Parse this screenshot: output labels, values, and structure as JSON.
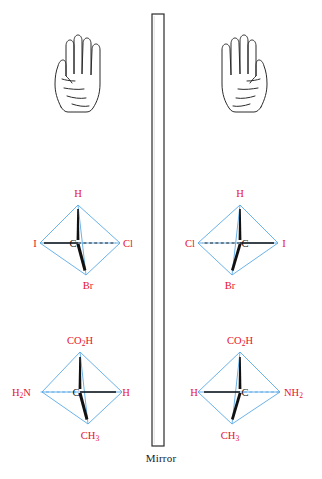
{
  "figure": {
    "caption": "Mirror",
    "colors": {
      "label_red": "#e8112d",
      "bond_blue": "#5aa9e6",
      "bond_black": "#111111",
      "outline": "#2b2b2b"
    },
    "mirror": {
      "label": "Mirror",
      "orientation": "vertical"
    },
    "rows": [
      {
        "name": "hands",
        "left": {
          "object": "left-hand",
          "palm_facing": "viewer"
        },
        "right": {
          "object": "right-hand",
          "palm_facing": "viewer"
        }
      },
      {
        "name": "bromochloroiodomethane",
        "left": {
          "center": "C",
          "top": "H",
          "left": "I",
          "right": "Cl",
          "bottom": "Br"
        },
        "right": {
          "center": "C",
          "top": "H",
          "left": "Cl",
          "right": "I",
          "bottom": "Br"
        }
      },
      {
        "name": "alanine",
        "left": {
          "center": "C",
          "top": "CO2H",
          "top_main": "CO",
          "top_sub": "2",
          "top_tail": "H",
          "left_main": "H",
          "left_sub": "2",
          "left_tail": "N",
          "left": "H2N",
          "right": "H",
          "bottom": "CH3",
          "bottom_main": "CH",
          "bottom_sub": "3"
        },
        "right": {
          "center": "C",
          "top": "CO2H",
          "top_main": "CO",
          "top_sub": "2",
          "top_tail": "H",
          "left": "H",
          "right": "NH2",
          "right_main": "NH",
          "right_sub": "2",
          "bottom": "CH3",
          "bottom_main": "CH",
          "bottom_sub": "3"
        }
      }
    ]
  }
}
